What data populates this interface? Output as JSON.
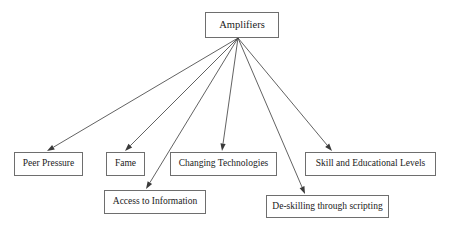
{
  "diagram": {
    "type": "node-link-tree",
    "orientation": "top-down",
    "canvas": {
      "width": 449,
      "height": 228
    },
    "style": {
      "background_color": "#ffffff",
      "node_border_color": "#6e6e6e",
      "node_fill_color": "#ffffff",
      "text_color": "#1a1a1a",
      "edge_color": "#3a3a3a"
    },
    "root": {
      "id": "amplifiers",
      "label": "Amplifiers",
      "x": 205,
      "y": 12,
      "width": 74,
      "height": 26,
      "font_size": 10.5
    },
    "children": [
      {
        "id": "peer-pressure",
        "label": "Peer Pressure",
        "x": 14,
        "y": 152,
        "width": 69,
        "height": 24,
        "font_size": 9.5,
        "arrow_tip": {
          "x": 47,
          "y": 151
        }
      },
      {
        "id": "fame",
        "label": "Fame",
        "x": 106,
        "y": 152,
        "width": 39,
        "height": 24,
        "font_size": 9.5,
        "arrow_tip": {
          "x": 125,
          "y": 151
        }
      },
      {
        "id": "changing-technologies",
        "label": "Changing Technologies",
        "x": 170,
        "y": 152,
        "width": 107,
        "height": 24,
        "font_size": 9.5,
        "arrow_tip": {
          "x": 222,
          "y": 151
        }
      },
      {
        "id": "skill-and-educational-levels",
        "label": "Skill and Educational Levels",
        "x": 305,
        "y": 152,
        "width": 131,
        "height": 24,
        "font_size": 9.5,
        "arrow_tip": {
          "x": 332,
          "y": 151
        }
      },
      {
        "id": "access-to-information",
        "label": "Access to Information",
        "x": 104,
        "y": 190,
        "width": 102,
        "height": 24,
        "font_size": 9.5,
        "arrow_tip": {
          "x": 146,
          "y": 189
        }
      },
      {
        "id": "de-skilling-through-scripting",
        "label": "De-skilling through scripting",
        "x": 266,
        "y": 195,
        "width": 123,
        "height": 23,
        "font_size": 9.5,
        "arrow_tip": {
          "x": 305,
          "y": 194
        }
      }
    ],
    "edge_origin": {
      "x": 238,
      "y": 38
    }
  }
}
